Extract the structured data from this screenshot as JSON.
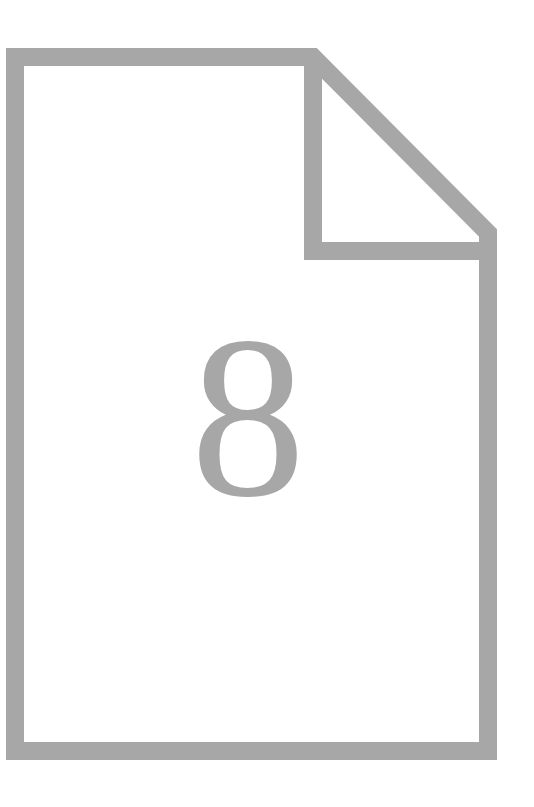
{
  "document_icon": {
    "icon_name": "file-document-with-folded-corner-icon",
    "description": "Outlined page glyph with a turned-down top-right corner",
    "stroke_color": "#a7a7a7",
    "fill_color": "#ffffff",
    "background_color": "#ffffff",
    "stroke_width": 18,
    "canvas": {
      "width": 534,
      "height": 807
    },
    "geometry": {
      "page_left": 15,
      "page_top": 57,
      "page_right": 488,
      "page_bottom": 751,
      "fold_x": 313,
      "fold_y": 251
    },
    "page_label": {
      "value": "8",
      "label_name": "page-number",
      "font_size": 230,
      "color": "#a7a7a7",
      "center_x": 248,
      "center_y": 417
    }
  }
}
